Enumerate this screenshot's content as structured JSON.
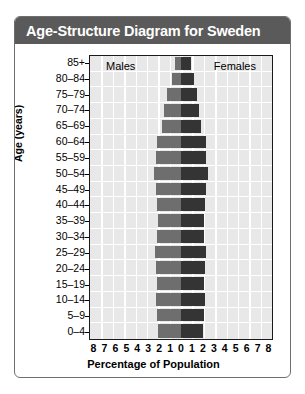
{
  "card": {
    "title": "Age-Structure Diagram for Sweden"
  },
  "legend": {
    "males": "Males",
    "females": "Females"
  },
  "axis": {
    "ylabel": "Age (years)",
    "xlabel": "Percentage of Population",
    "xticks": [
      "8",
      "7",
      "6",
      "5",
      "4",
      "3",
      "2",
      "1",
      "0",
      "1",
      "2",
      "3",
      "4",
      "5",
      "6",
      "7",
      "8"
    ]
  },
  "colors": {
    "titlebar": "#5a5a5a",
    "males": "#6e6e6e",
    "females": "#343434",
    "plot_background": "#e8e8e8",
    "gridline": "#ffffff",
    "frame": "#1a1a1a"
  },
  "chart_data": {
    "type": "bar",
    "subtype": "population-pyramid",
    "title": "Age-Structure Diagram for Sweden",
    "xlabel": "Percentage of Population",
    "ylabel": "Age (years)",
    "xlim": [
      -8,
      8
    ],
    "xtick_values": [
      8,
      7,
      6,
      5,
      4,
      3,
      2,
      1,
      0,
      1,
      2,
      3,
      4,
      5,
      6,
      7,
      8
    ],
    "grid": true,
    "legend_position": "inside-top",
    "categories": [
      "85+",
      "80-84",
      "75-79",
      "70-74",
      "65-69",
      "60-64",
      "55-59",
      "50-54",
      "45-49",
      "40-44",
      "35-39",
      "30-34",
      "25-29",
      "20-24",
      "15-19",
      "10-14",
      "5-9",
      "0-4"
    ],
    "series": [
      {
        "name": "Males",
        "side": "left",
        "color": "#6e6e6e",
        "values": [
          0.5,
          0.8,
          1.2,
          1.5,
          1.7,
          2.1,
          2.2,
          2.4,
          2.2,
          2.1,
          2.0,
          2.1,
          2.3,
          2.2,
          2.1,
          2.2,
          2.1,
          2.0
        ]
      },
      {
        "name": "Females",
        "side": "right",
        "color": "#343434",
        "values": [
          0.9,
          1.1,
          1.4,
          1.6,
          1.8,
          2.2,
          2.2,
          2.4,
          2.2,
          2.1,
          2.0,
          2.0,
          2.2,
          2.1,
          2.0,
          2.1,
          2.0,
          1.9
        ]
      }
    ]
  }
}
